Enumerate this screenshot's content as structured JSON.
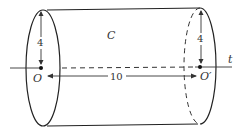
{
  "diagram": {
    "type": "cylinder",
    "region_label": "C",
    "axis_label": "t",
    "left_center_label": "O",
    "right_center_label": "O′",
    "radius_left_label": "4",
    "radius_right_label": "4",
    "length_label": "10",
    "radius": 4,
    "length": 10
  }
}
